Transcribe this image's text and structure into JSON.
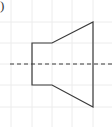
{
  "figure": {
    "label": ")",
    "colors": {
      "line": "#3a3a3a",
      "grid": "#ececec",
      "axis": "#3a3a3a",
      "background": "#ffffff"
    },
    "grid": {
      "x": [
        11,
        32,
        52,
        72,
        93
      ],
      "y": [
        22,
        43,
        64,
        85,
        107
      ]
    },
    "shape": {
      "description": "Side profile of a solid: rectangle joined to a trapezoid (frustum), symmetric about dashed axis",
      "points": "32,43 52,43 93,22 93,107 52,85 32,85"
    },
    "inner_edge": {
      "x1": 52,
      "y1": 43,
      "x2": 52,
      "y2": 85
    },
    "axis": {
      "x1": 10,
      "y1": 64,
      "x2": 112,
      "y2": 64,
      "style": "dashed"
    }
  }
}
